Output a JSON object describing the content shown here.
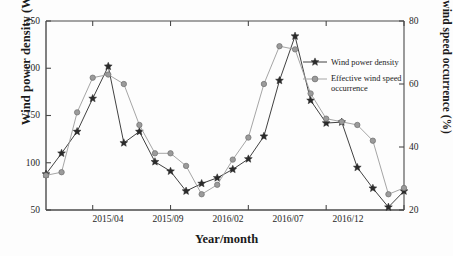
{
  "chart_data": {
    "type": "line",
    "title": "",
    "xlabel": "Year/month",
    "ylabel": "Wind power density (W/m²)",
    "ylabel_right": "Effective wind speed occurrence (%)",
    "x": [
      "2015/01",
      "2015/02",
      "2015/03",
      "2015/04",
      "2015/05",
      "2015/06",
      "2015/07",
      "2015/08",
      "2015/09",
      "2015/10",
      "2015/11",
      "2015/12",
      "2016/01",
      "2016/02",
      "2016/03",
      "2016/04",
      "2016/05",
      "2016/06",
      "2016/07",
      "2016/08",
      "2016/09",
      "2016/10",
      "2016/11",
      "2016/12"
    ],
    "xtick_labels": [
      "2015/04",
      "2015/09",
      "2016/02",
      "2016/07",
      "2016/12"
    ],
    "xtick_index": [
      3,
      8,
      13,
      18,
      23
    ],
    "ytick_labels_left": [
      "250",
      "200",
      "150",
      "100",
      "50"
    ],
    "ytick_values_left": [
      250,
      200,
      150,
      100,
      50
    ],
    "ytick_labels_right": [
      "80",
      "60",
      "40",
      "20"
    ],
    "ytick_values_right": [
      80,
      60,
      40,
      20
    ],
    "ylim": [
      50,
      250
    ],
    "ylim_right": [
      20,
      80
    ],
    "grid": false,
    "legend_position": "upper-right",
    "series": [
      {
        "name": "Wind power density",
        "axis": "left",
        "marker": "star",
        "color": "#2b2b2b",
        "values": [
          88,
          110,
          133,
          168,
          202,
          121,
          133,
          101,
          91,
          70,
          78,
          84,
          93,
          104,
          128,
          187,
          234,
          166,
          142,
          143,
          95,
          73,
          53,
          70
        ]
      },
      {
        "name": "Effective wind speed occurrence",
        "axis": "right",
        "marker": "circle",
        "color": "#9b9b9b",
        "values": [
          31,
          32,
          51,
          62,
          63,
          60,
          47,
          38,
          38,
          34,
          25,
          28,
          36,
          43,
          60,
          72,
          71,
          57,
          49,
          48,
          47,
          42,
          25,
          27
        ]
      }
    ]
  },
  "legend": {
    "items": [
      {
        "label": "Wind power density",
        "marker": "star-marker",
        "color": "#2b2b2b"
      },
      {
        "label_line1": "Effective wind speed",
        "label_line2": "occurrence",
        "marker": "circle-marker",
        "color": "#9b9b9b"
      }
    ]
  },
  "colors": {
    "series_primary": "#2b2b2b",
    "series_secondary": "#9b9b9b",
    "axis": "#4a4a4a",
    "background": "#fdfdfd"
  }
}
